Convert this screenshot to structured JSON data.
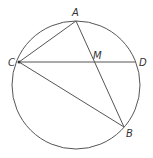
{
  "diagram": {
    "type": "geometry-circle",
    "circle": {
      "cx": 76,
      "cy": 85,
      "r": 64
    },
    "points": {
      "A": {
        "x": 76,
        "y": 21,
        "label": "A",
        "lx": 72,
        "ly": 16
      },
      "B": {
        "x": 124,
        "y": 127,
        "label": "B",
        "lx": 126,
        "ly": 137
      },
      "C": {
        "x": 19,
        "y": 62,
        "label": "C",
        "lx": 8,
        "ly": 66
      },
      "D": {
        "x": 135,
        "y": 62,
        "label": "D",
        "lx": 140,
        "ly": 66
      },
      "M": {
        "x": 96,
        "y": 62,
        "label": "M",
        "lx": 94,
        "ly": 59
      }
    },
    "segments": [
      {
        "from": "C",
        "to": "A"
      },
      {
        "from": "A",
        "to": "B"
      },
      {
        "from": "C",
        "to": "B"
      },
      {
        "from": "C",
        "to": "D"
      }
    ],
    "stroke_color": "#555555"
  }
}
